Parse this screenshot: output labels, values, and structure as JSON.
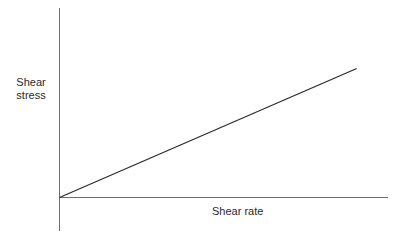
{
  "chart_data": {
    "type": "line",
    "title": "",
    "xlabel": "Shear rate",
    "ylabel": "Shear stress",
    "ylabel_lines": [
      "Shear",
      "stress"
    ],
    "x_ticks": [],
    "y_ticks": [],
    "grid": false,
    "legend": null,
    "xlim": [
      0,
      1
    ],
    "ylim": [
      0,
      1
    ],
    "series": [
      {
        "name": "Shear stress vs shear rate",
        "x": [
          0,
          0.906
        ],
        "y": [
          0,
          0.686
        ],
        "color": "#2b2b2b"
      }
    ],
    "axis_color": "#6e6e6e"
  }
}
